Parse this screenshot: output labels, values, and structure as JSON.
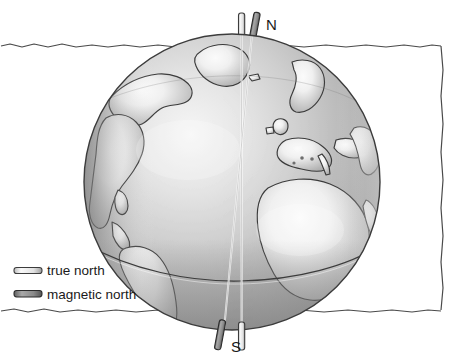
{
  "figure": {
    "name": "earth-magnetic-axis-diagram",
    "background_color": "#ffffff"
  },
  "border": {
    "name": "hand-drawn-frame",
    "stroke_color": "#4a4a4a",
    "stroke_width": 1.2
  },
  "globe": {
    "center_x": 232,
    "center_y": 182,
    "radius_x": 148,
    "radius_y": 148,
    "ocean_light_color": "#d9d9d9",
    "ocean_dark_color": "#9a9a9a",
    "land_color": "#b3b3b3",
    "land_highlight_color": "#f2f2f2",
    "outline_color": "#3c3c3c",
    "equator_color": "#3c3c3c"
  },
  "axes": {
    "true_north": {
      "label": "true north",
      "rod_fill": "#f0f0f0",
      "rod_stroke": "#3c3c3c",
      "tilt_degrees": 0
    },
    "magnetic_north": {
      "label": "magnetic north",
      "rod_fill": "#8c8c8c",
      "rod_stroke": "#2b2b2b",
      "tilt_degrees": 11
    }
  },
  "pole_labels": {
    "north": "N",
    "south": "S"
  },
  "legend": {
    "name": "axis-legend",
    "items": [
      {
        "label": "true north",
        "swatch": "true-north-rod-icon",
        "fill": "#f2f2f2",
        "stroke": "#3c3c3c"
      },
      {
        "label": "magnetic north",
        "swatch": "magnetic-north-rod-icon",
        "fill": "#8c8c8c",
        "stroke": "#2b2b2b"
      }
    ]
  }
}
